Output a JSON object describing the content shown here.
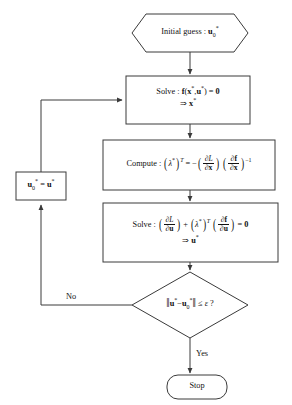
{
  "diagram": {
    "type": "flowchart",
    "colors": {
      "stroke": "#3a3a3a",
      "fill": "#ffffff",
      "text": "#111111",
      "background": "#ffffff"
    },
    "nodes": [
      {
        "id": "initial-guess",
        "shape": "hexagon",
        "label": "Initial guess : u0*",
        "text_parts": {
          "prefix": "Initial guess : ",
          "symbol": "u",
          "subscript": "0",
          "superscript": "*"
        }
      },
      {
        "id": "solve-state",
        "shape": "rectangle",
        "label": "Solve : f(x*,u*) = 0  ⇒ x*",
        "line1": "Solve : f(x*,u*) = 0",
        "line2": "⇒ x*"
      },
      {
        "id": "compute-lambda",
        "shape": "rectangle",
        "label": "Compute : (λ*)^T = −(∂L/∂x)(∂f/∂x)^−1",
        "prefix": "Compute : ",
        "lhs": "(λ*)^T",
        "equals": "=",
        "sign": "−",
        "frac1_num": "∂L",
        "frac1_den": "∂x",
        "frac2_num": "∂f",
        "frac2_den": "∂x",
        "exponent": "−1"
      },
      {
        "id": "solve-control",
        "shape": "rectangle",
        "label": "Solve : (∂L/∂u) + (λ*)^T (∂f/∂u) = 0  ⇒ u*",
        "prefix": "Solve : ",
        "frac1_num": "∂L",
        "frac1_den": "∂u",
        "plus": "+",
        "lambda_term": "(λ*)^T",
        "frac2_num": "∂f",
        "frac2_den": "∂u",
        "equals_zero": "= 0",
        "line2": "⇒ u*"
      },
      {
        "id": "convergence-test",
        "shape": "diamond",
        "label": "‖u* − u0*‖ ≤ ε ?",
        "norm_open": "‖",
        "expr_a": "u*",
        "minus": "−",
        "expr_b": "u0*",
        "norm_close": "‖",
        "comparator": "≤",
        "tolerance": "ε",
        "question": "?"
      },
      {
        "id": "update-guess",
        "shape": "rectangle",
        "label": "u0* = u*",
        "lhs": "u0*",
        "equals": "=",
        "rhs": "u*"
      },
      {
        "id": "stop",
        "shape": "rounded-rectangle",
        "label": "Stop"
      }
    ],
    "edge_labels": {
      "no": "No",
      "yes": "Yes"
    }
  }
}
